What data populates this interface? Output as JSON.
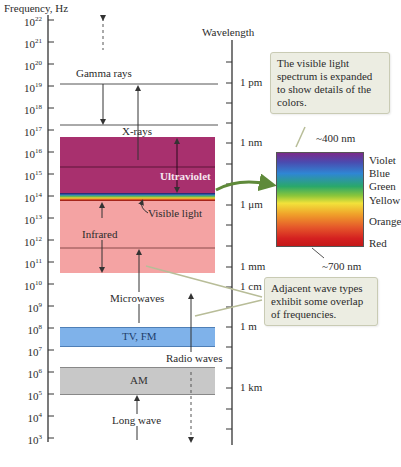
{
  "axes": {
    "left_title": "Frequency, Hz",
    "right_title": "Wavelength",
    "frequency_ticks": [
      {
        "base": "10",
        "exp": "22",
        "y": 20
      },
      {
        "base": "10",
        "exp": "21",
        "y": 42
      },
      {
        "base": "10",
        "exp": "20",
        "y": 64
      },
      {
        "base": "10",
        "exp": "19",
        "y": 86
      },
      {
        "base": "10",
        "exp": "18",
        "y": 108
      },
      {
        "base": "10",
        "exp": "17",
        "y": 130
      },
      {
        "base": "10",
        "exp": "16",
        "y": 152
      },
      {
        "base": "10",
        "exp": "15",
        "y": 174
      },
      {
        "base": "10",
        "exp": "14",
        "y": 196
      },
      {
        "base": "10",
        "exp": "13",
        "y": 218
      },
      {
        "base": "10",
        "exp": "12",
        "y": 240
      },
      {
        "base": "10",
        "exp": "11",
        "y": 262
      },
      {
        "base": "10",
        "exp": "10",
        "y": 284
      },
      {
        "base": "10",
        "exp": "9",
        "y": 306
      },
      {
        "base": "10",
        "exp": "8",
        "y": 328
      },
      {
        "base": "10",
        "exp": "7",
        "y": 350
      },
      {
        "base": "10",
        "exp": "6",
        "y": 372
      },
      {
        "base": "10",
        "exp": "5",
        "y": 394
      },
      {
        "base": "10",
        "exp": "4",
        "y": 416
      },
      {
        "base": "10",
        "exp": "3",
        "y": 438
      }
    ],
    "wavelength_labels": [
      {
        "label": "1 pm",
        "y": 83
      },
      {
        "label": "1 nm",
        "y": 143
      },
      {
        "label": "1 μm",
        "y": 205
      },
      {
        "label": "1 mm",
        "y": 267
      },
      {
        "label": "1 cm",
        "y": 287
      },
      {
        "label": "1 m",
        "y": 327
      },
      {
        "label": "1 km",
        "y": 388
      }
    ]
  },
  "bands": {
    "gamma": {
      "label": "Gamma rays"
    },
    "xray": {
      "label": "X-rays"
    },
    "ultraviolet": {
      "label": "Ultraviolet",
      "color": "#a8306e"
    },
    "visible": {
      "label": "Visible light"
    },
    "infrared": {
      "label": "Infrared",
      "color": "#f4a3a3"
    },
    "microwaves": {
      "label": "Microwaves"
    },
    "tvfm": {
      "label": "TV, FM",
      "color": "#7fb2ea"
    },
    "radio": {
      "label": "Radio waves"
    },
    "am": {
      "label": "AM",
      "color": "#c8c8c8"
    },
    "longwave": {
      "label": "Long wave"
    }
  },
  "spectrum": {
    "top_label": "~400 nm",
    "bottom_label": "~700 nm",
    "colors": [
      "Violet",
      "Blue",
      "Green",
      "Yellow",
      "Orange",
      "Red"
    ]
  },
  "callouts": {
    "visible": "The visible light spectrum is expanded to show details of the colors.",
    "overlap": "Adjacent wave types exhibit some overlap of frequencies."
  }
}
